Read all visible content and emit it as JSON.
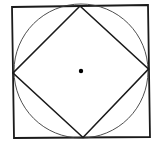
{
  "diagram": {
    "colors": {
      "background": "#ffffff",
      "stroke": "#1a1a1a",
      "circle_stroke": "#3a3a3a",
      "center_dot": "#000000"
    },
    "outer_square": {
      "points": [
        [
          12,
          7
        ],
        [
          148,
          5
        ],
        [
          150,
          137
        ],
        [
          14,
          138
        ]
      ],
      "stroke_width": 1.8
    },
    "circle": {
      "cx": 81,
      "cy": 71,
      "r": 67,
      "stroke_width": 0.9
    },
    "diamond": {
      "points": [
        [
          80,
          6
        ],
        [
          148.5,
          69
        ],
        [
          83,
          137.5
        ],
        [
          13,
          73
        ]
      ],
      "stroke_width": 1.6
    },
    "center_point": {
      "cx": 81,
      "cy": 71,
      "r": 2.2
    }
  }
}
